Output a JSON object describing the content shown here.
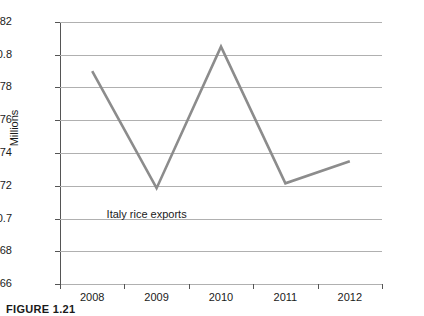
{
  "chart_data": {
    "type": "line",
    "title": "",
    "subtitle": "",
    "xlabel": "",
    "ylabel": "Millions",
    "categories": [
      "2008",
      "2009",
      "2010",
      "2011",
      "2012"
    ],
    "series": [
      {
        "name": "Italy rice exports",
        "values": [
          0.79,
          0.7185,
          0.805,
          0.7215,
          0.735
        ],
        "color": "#8c8c8c"
      }
    ],
    "ylim": [
      0.66,
      0.82
    ],
    "yticks": [
      "0.82",
      "0.8",
      "0.78",
      "0.76",
      "0.74",
      "0.72",
      "0.7",
      "0.68",
      "0.66"
    ],
    "ytick_values": [
      0.82,
      0.8,
      0.78,
      0.76,
      0.74,
      0.72,
      0.7,
      0.68,
      0.66
    ],
    "grid": true,
    "legend_position": "none",
    "annotations": [
      {
        "text": "Italy rice exports",
        "x_category": "2009",
        "y_value": 0.702
      }
    ],
    "gridline_color": "#b0b0b0",
    "axis_color": "#555555",
    "background": "#ffffff"
  },
  "caption": {
    "text": "FIGURE 1.21"
  }
}
